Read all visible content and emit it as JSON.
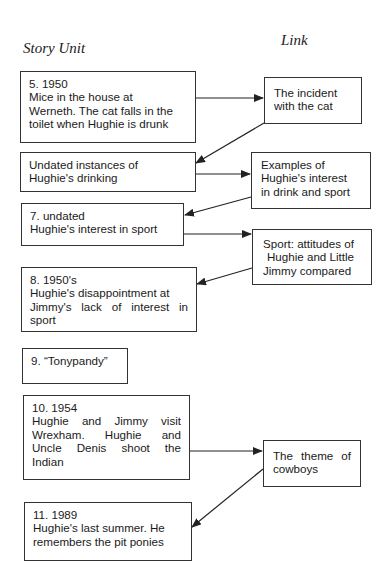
{
  "headers": {
    "story_unit": "Story Unit",
    "link": "Link"
  },
  "story_units": [
    {
      "id": "unit-5",
      "lines": [
        "5. 1950",
        "Mice in the house at",
        "Werneth. The cat falls in the",
        "toilet when Hughie is drunk"
      ]
    },
    {
      "id": "unit-undated-drinking",
      "lines": [
        "Undated instances of",
        "Hughie's drinking"
      ]
    },
    {
      "id": "unit-7",
      "lines": [
        "7. undated",
        "Hughie's interest in sport"
      ]
    },
    {
      "id": "unit-8",
      "lines": [
        "8. 1950's",
        "Hughie's disappointment at",
        "Jimmy's lack of interest in",
        "sport"
      ]
    },
    {
      "id": "unit-9",
      "lines": [
        "9. “Tonypandy”"
      ]
    },
    {
      "id": "unit-10",
      "lines": [
        "10. 1954",
        "Hughie and Jimmy visit",
        "Wrexham. Hughie and",
        "Uncle Denis shoot the",
        "Indian"
      ]
    },
    {
      "id": "unit-11",
      "lines": [
        "11. 1989",
        "Hughie's last summer. He",
        "remembers the pit ponies"
      ]
    }
  ],
  "links": [
    {
      "id": "link-cat",
      "lines": [
        "The incident",
        "with the cat"
      ]
    },
    {
      "id": "link-drink-sport",
      "lines": [
        "Examples of",
        "Hughie's interest",
        "in drink and sport"
      ]
    },
    {
      "id": "link-sport-attitudes",
      "lines": [
        "Sport: attitudes of",
        "Hughie and Little",
        "Jimmy compared"
      ]
    },
    {
      "id": "link-cowboys",
      "lines": [
        "The theme of",
        "cowboys"
      ]
    }
  ],
  "connections": [
    {
      "from": "unit-5",
      "to": "link-cat"
    },
    {
      "from": "link-cat",
      "to": "unit-undated-drinking"
    },
    {
      "from": "unit-undated-drinking",
      "to": "link-drink-sport"
    },
    {
      "from": "link-drink-sport",
      "to": "unit-7"
    },
    {
      "from": "unit-7",
      "to": "link-sport-attitudes"
    },
    {
      "from": "link-sport-attitudes",
      "to": "unit-8"
    },
    {
      "from": "unit-10",
      "to": "link-cowboys"
    },
    {
      "from": "link-cowboys",
      "to": "unit-11"
    }
  ],
  "colors": {
    "line": "#222222",
    "border": "#333333",
    "text": "#1a1a1a",
    "background": "#ffffff"
  }
}
